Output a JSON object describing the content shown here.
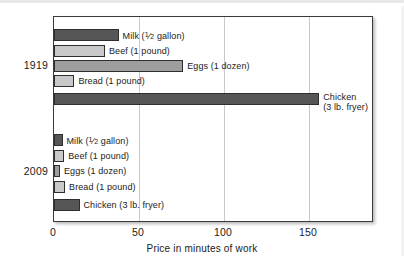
{
  "chart_data": {
    "type": "bar",
    "orientation": "horizontal",
    "title": "",
    "xlabel": "Price in minutes of work",
    "ylabel": "",
    "xlim": [
      0,
      188
    ],
    "xticks": [
      0,
      50,
      100,
      150
    ],
    "xtick_labels": [
      "0",
      "50",
      "100",
      "150"
    ],
    "grid": "vertical",
    "legend": "none (bars labeled inline)",
    "groups": [
      "1919",
      "2009"
    ],
    "categories": [
      "Milk (1/2 gallon)",
      "Beef (1 pound)",
      "Eggs (1 dozen)",
      "Bread (1 pound)",
      "Chicken (3 lb. fryer)"
    ],
    "series": [
      {
        "name": "1919",
        "values": [
          38,
          30,
          76,
          12,
          156
        ]
      },
      {
        "name": "2009",
        "values": [
          5,
          6,
          3.5,
          6.5,
          15
        ]
      }
    ]
  },
  "axis": {
    "ticks": [
      {
        "label": "0",
        "value": 0
      },
      {
        "label": "50",
        "value": 50
      },
      {
        "label": "100",
        "value": 100
      },
      {
        "label": "150",
        "value": 150
      }
    ],
    "title": "Price in minutes of work"
  },
  "groups": [
    {
      "label": "1919"
    },
    {
      "label": "2009"
    }
  ],
  "bars": [
    {
      "group": "1919",
      "item": "milk",
      "label_pre": "Milk (",
      "label_num": "1",
      "label_den": "2",
      "label_post": " gallon)",
      "value": 38,
      "shade": "dark"
    },
    {
      "group": "1919",
      "item": "beef",
      "label": "Beef (1 pound)",
      "value": 30,
      "shade": "light"
    },
    {
      "group": "1919",
      "item": "eggs",
      "label": "Eggs (1 dozen)",
      "value": 76,
      "shade": "mid"
    },
    {
      "group": "1919",
      "item": "bread",
      "label": "Bread (1 pound)",
      "value": 12,
      "shade": "light"
    },
    {
      "group": "1919",
      "item": "chicken",
      "label_line1": "Chicken",
      "label_line2": "(3 lb. fryer)",
      "value": 156,
      "shade": "dark"
    },
    {
      "group": "2009",
      "item": "milk",
      "label_pre": "Milk (",
      "label_num": "1",
      "label_den": "2",
      "label_post": " gallon)",
      "value": 5,
      "shade": "dark"
    },
    {
      "group": "2009",
      "item": "beef",
      "label": "Beef (1 pound)",
      "value": 6,
      "shade": "light"
    },
    {
      "group": "2009",
      "item": "eggs",
      "label": "Eggs (1 dozen)",
      "value": 3.5,
      "shade": "mid"
    },
    {
      "group": "2009",
      "item": "bread",
      "label": "Bread (1 pound)",
      "value": 6.5,
      "shade": "light"
    },
    {
      "group": "2009",
      "item": "chicken",
      "label": "Chicken (3 lb. fryer)",
      "value": 15,
      "shade": "dark"
    }
  ],
  "colors": {
    "dark_bar": "#565656",
    "mid_bar": "#9e9e9e",
    "light_bar": "#c9c9c9",
    "bar_outline": "#2e2e2e",
    "frame": "#3a3a3a",
    "gridline": "#c9c9c9",
    "text": "#1b1b1b",
    "background": "#ffffff"
  }
}
